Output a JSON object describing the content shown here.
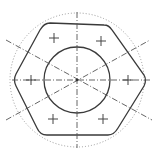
{
  "diagram": {
    "type": "technical-drawing",
    "colors": {
      "outline": "#3a3a3a",
      "centerline": "#555555",
      "dotted_circle": "#9a9a9a",
      "marks": "#444444",
      "background": "#ffffff"
    },
    "center": [
      77,
      80
    ],
    "elements": {
      "hexagon": {
        "shape": "rounded-hexagon",
        "style": "solid"
      },
      "inner_circle": {
        "radius": 33,
        "style": "solid"
      },
      "outer_circle": {
        "radius": 67,
        "style": "dotted"
      },
      "centerlines": {
        "count": 4,
        "style": "dash-dot",
        "angles_deg": [
          0,
          90,
          30,
          -30
        ]
      },
      "cross_marks": {
        "count": 6,
        "positions": [
          [
            54,
            38
          ],
          [
            101,
            41
          ],
          [
            31,
            80
          ],
          [
            128,
            80
          ],
          [
            53,
            119
          ],
          [
            103,
            119
          ]
        ]
      }
    }
  }
}
